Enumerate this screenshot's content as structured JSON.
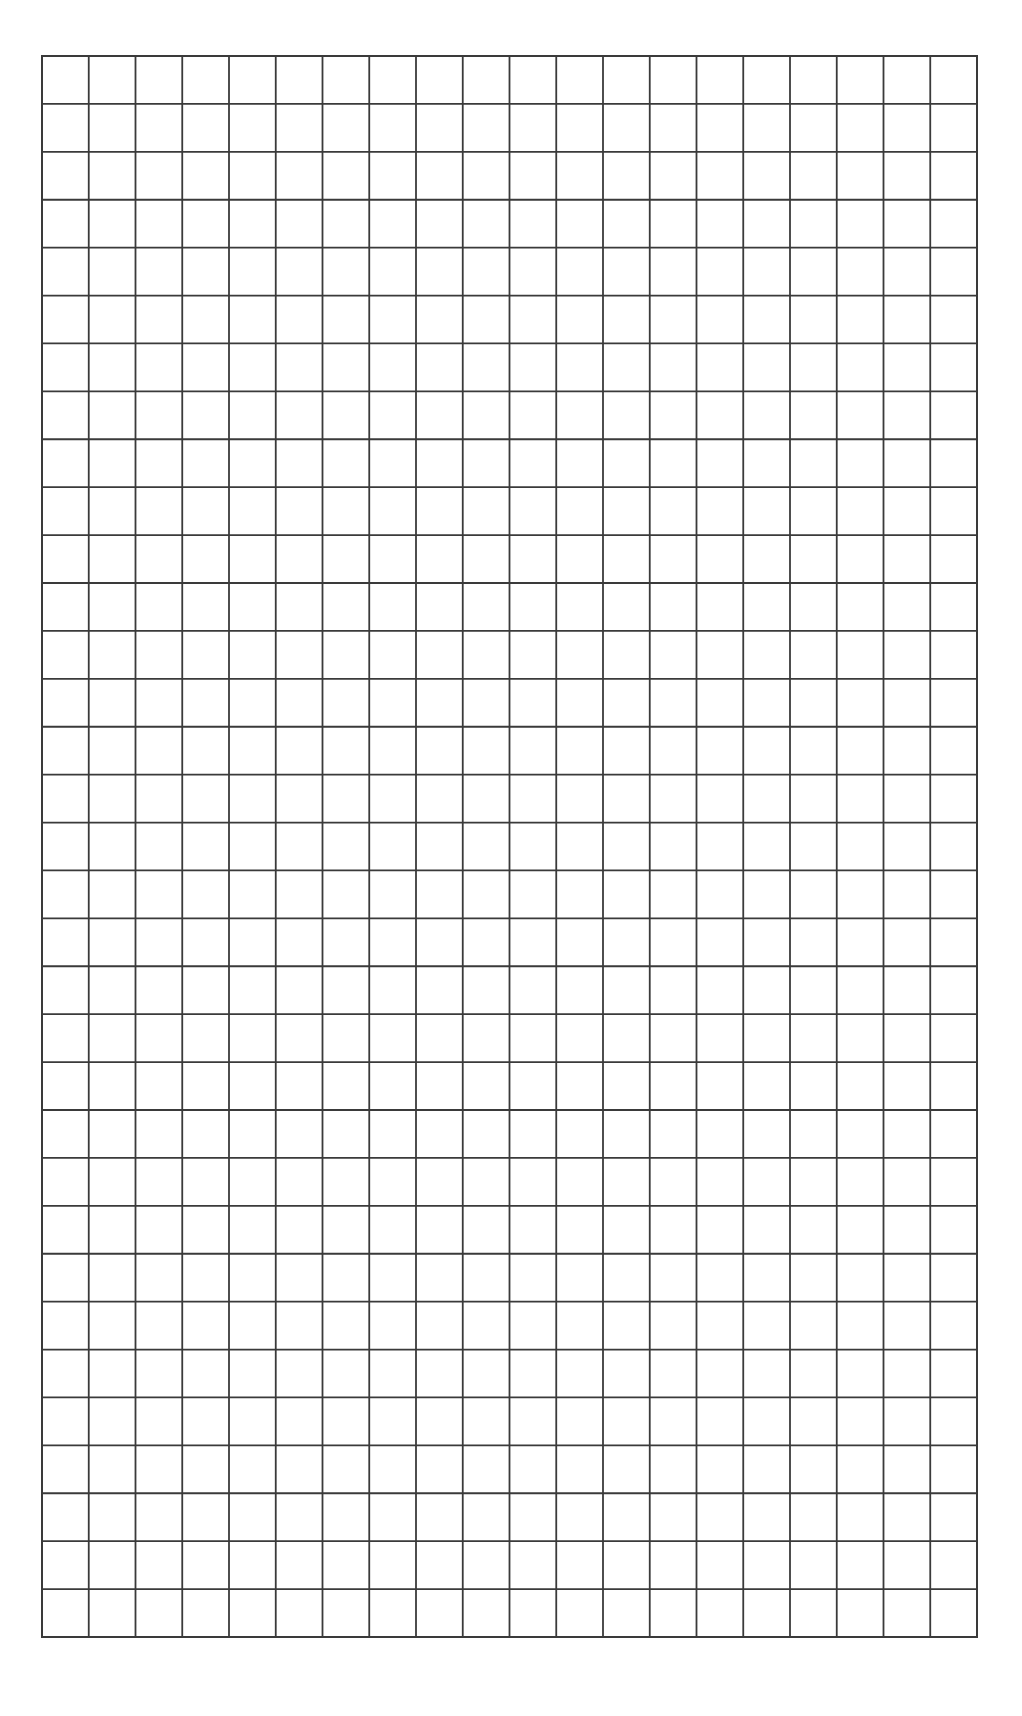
{
  "page": {
    "background_color": "#ffffff"
  },
  "grid": {
    "columns": 20,
    "rows": 33,
    "line_color": "#3a3a3a",
    "line_width": 1.8,
    "border_width": 2
  }
}
